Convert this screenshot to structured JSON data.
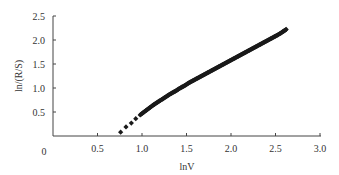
{
  "chart_data": {
    "type": "scatter",
    "title": "",
    "xlabel": "lnV",
    "ylabel": "ln/(R/S)",
    "xlim": [
      0,
      3.0
    ],
    "ylim": [
      0,
      2.5
    ],
    "grid": false,
    "legend": null,
    "origin_label": "0",
    "x_ticks": [
      0.5,
      1.0,
      1.5,
      2.0,
      2.5,
      3.0
    ],
    "x_tick_labels": [
      "0.5",
      "1.0",
      "1.5",
      "2.0",
      "2.5",
      "3.0"
    ],
    "y_ticks": [
      0.5,
      1.0,
      1.5,
      2.0,
      2.5
    ],
    "y_tick_labels": [
      "0.5",
      "1.0",
      "1.5",
      "2.0",
      "2.5"
    ],
    "marker": "diamond",
    "marker_color": "#1a1a1a",
    "series": [
      {
        "name": "ln(R/S) vs lnV",
        "x": [
          0.76,
          0.82,
          0.88,
          0.93,
          0.98,
          1.03,
          1.08,
          1.13,
          1.18,
          1.23,
          1.28,
          1.33,
          1.38,
          1.43,
          1.48,
          1.53,
          1.58,
          1.63,
          1.68,
          1.73,
          1.78,
          1.83,
          1.88,
          1.93,
          1.98,
          2.03,
          2.08,
          2.13,
          2.18,
          2.23,
          2.28,
          2.33,
          2.38,
          2.43,
          2.48,
          2.53,
          2.58,
          2.62
        ],
        "y": [
          0.08,
          0.19,
          0.27,
          0.36,
          0.44,
          0.51,
          0.58,
          0.65,
          0.71,
          0.77,
          0.83,
          0.89,
          0.94,
          1.0,
          1.05,
          1.11,
          1.16,
          1.21,
          1.26,
          1.31,
          1.36,
          1.41,
          1.46,
          1.51,
          1.56,
          1.61,
          1.66,
          1.71,
          1.76,
          1.81,
          1.86,
          1.91,
          1.96,
          2.01,
          2.06,
          2.11,
          2.17,
          2.22
        ]
      }
    ]
  }
}
